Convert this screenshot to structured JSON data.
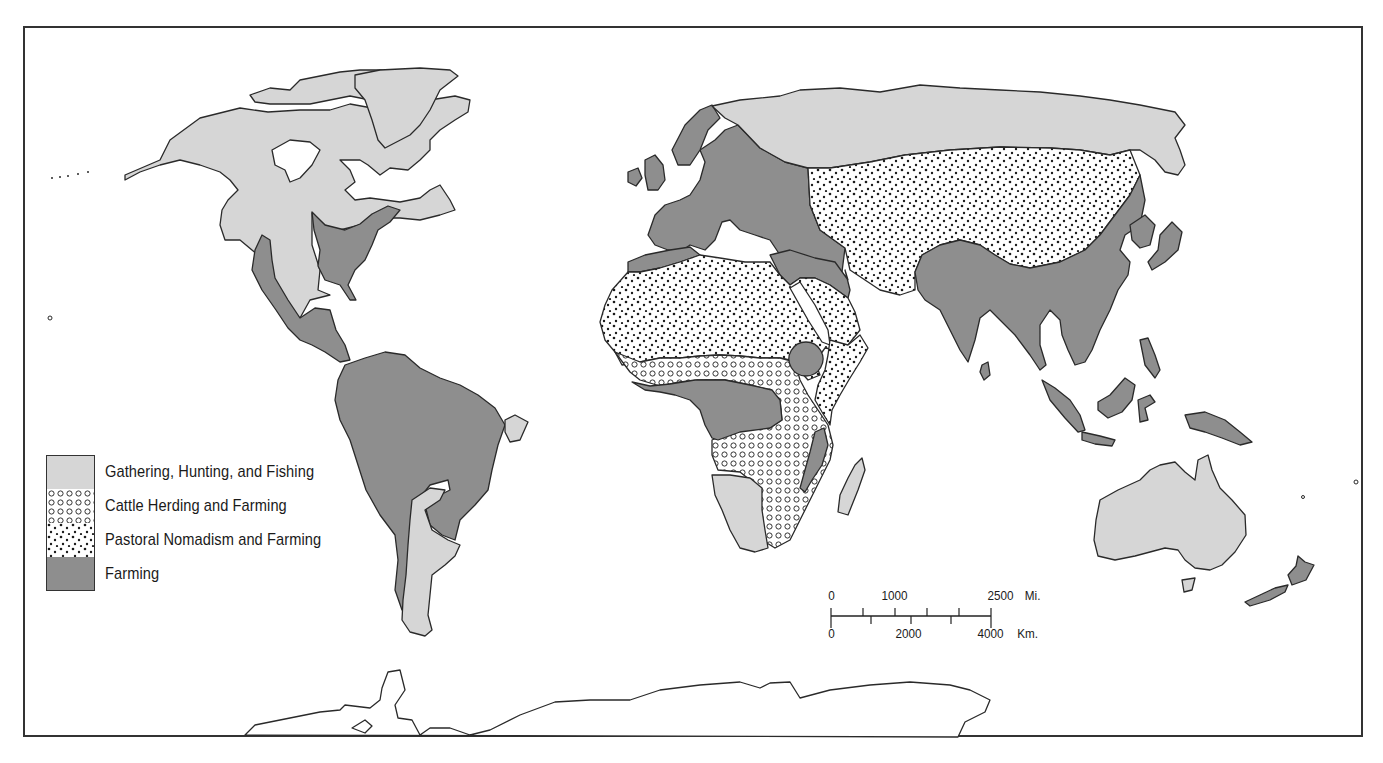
{
  "map": {
    "type": "world-thematic-map",
    "colors": {
      "gathering": "#d6d6d6",
      "farming": "#8e8e8e",
      "pattern_bg": "#ffffff",
      "outline": "#2a2a2a",
      "ocean": "#ffffff"
    },
    "regions": [
      {
        "name": "North America (north & west)",
        "category": "Gathering, Hunting, and Fishing"
      },
      {
        "name": "Eastern United States",
        "category": "Farming"
      },
      {
        "name": "Mexico & Central America",
        "category": "Farming"
      },
      {
        "name": "Greenland",
        "category": "Gathering, Hunting, and Fishing"
      },
      {
        "name": "South America (north & east)",
        "category": "Farming"
      },
      {
        "name": "Patagonia",
        "category": "Gathering, Hunting, and Fishing"
      },
      {
        "name": "Europe",
        "category": "Farming"
      },
      {
        "name": "Northern Russia / Siberia",
        "category": "Gathering, Hunting, and Fishing"
      },
      {
        "name": "Central Asia",
        "category": "Pastoral Nomadism and Farming"
      },
      {
        "name": "South & East Asia",
        "category": "Farming"
      },
      {
        "name": "North Africa & Arabia",
        "category": "Pastoral Nomadism and Farming"
      },
      {
        "name": "Sahel & East Africa",
        "category": "Cattle Herding and Farming"
      },
      {
        "name": "Central Africa",
        "category": "Farming"
      },
      {
        "name": "Ethiopian Highlands",
        "category": "Farming"
      },
      {
        "name": "Southwest Africa",
        "category": "Gathering, Hunting, and Fishing"
      },
      {
        "name": "Madagascar",
        "category": "Gathering, Hunting, and Fishing"
      },
      {
        "name": "Australia",
        "category": "Gathering, Hunting, and Fishing"
      },
      {
        "name": "New Zealand",
        "category": "Farming"
      },
      {
        "name": "Southeast Asian Islands",
        "category": "Farming"
      },
      {
        "name": "Antarctica",
        "category": "none"
      }
    ]
  },
  "legend": {
    "items": [
      {
        "label": "Gathering, Hunting, and Fishing",
        "pattern": "light-gray-fill"
      },
      {
        "label": "Cattle Herding and Farming",
        "pattern": "small-circles"
      },
      {
        "label": "Pastoral Nomadism and Farming",
        "pattern": "dots"
      },
      {
        "label": "Farming",
        "pattern": "dark-gray-fill"
      }
    ]
  },
  "scale_bar": {
    "miles_labels": [
      "0",
      "1000",
      "2500"
    ],
    "miles_unit": "Mi.",
    "km_labels": [
      "0",
      "2000",
      "4000"
    ],
    "km_unit": "Km."
  }
}
